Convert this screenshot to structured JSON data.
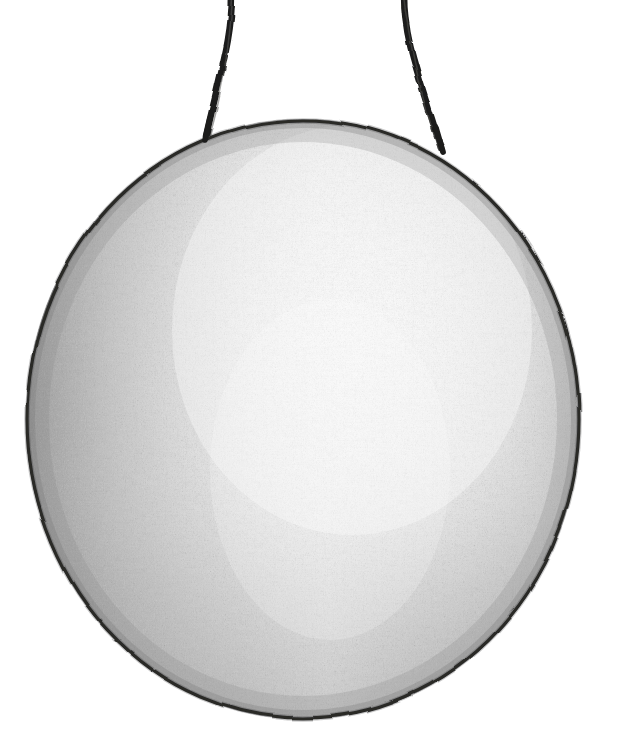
{
  "canvas": {
    "width": 623,
    "height": 748,
    "background_color": "#ffffff",
    "medium": "graphite pencil on paper",
    "title": "Hanging Gong"
  },
  "palette": {
    "paper_white": "#ffffff",
    "outline_dark": "#20201f",
    "cord_dark": "#1c1c1b",
    "shade_deep": "#8e8e8e",
    "shade_mid": "#b4b4b4",
    "shade_light": "#dcdcdc",
    "highlight": "#fafafa",
    "speckle": "#6f6f6f"
  },
  "subject": {
    "name": "gong-disc",
    "label": "Gong disc",
    "shape": "circle",
    "center_x": 303,
    "center_y": 419,
    "radius_x": 277,
    "radius_y": 300,
    "bounds": {
      "left": 26,
      "top": 119,
      "right": 580,
      "bottom": 719
    },
    "outline_width": 3.2
  },
  "cords": [
    {
      "name": "cord-left",
      "label": "Left suspension cord",
      "top_x": 232,
      "top_y": -6,
      "bottom_x": 206,
      "bottom_y": 136,
      "mid_x": 222,
      "mid_y": 66,
      "width": 6.5
    },
    {
      "name": "cord-right",
      "label": "Right suspension cord",
      "top_x": 404,
      "top_y": -6,
      "bottom_x": 441,
      "bottom_y": 148,
      "mid_x": 417,
      "mid_y": 70,
      "width": 6.5
    }
  ],
  "shading": {
    "description": "Soft graphite gradient: deepest tone along the left and lower-left rim, broad bright highlight through the centre and upper-right of the disc.",
    "highlight_center_x_pct": 58,
    "highlight_center_y_pct": 36,
    "stops": [
      {
        "offset_pct": 0,
        "color": "#fcfcfc",
        "opacity": 1
      },
      {
        "offset_pct": 32,
        "color": "#f0f0f0",
        "opacity": 1
      },
      {
        "offset_pct": 58,
        "color": "#d2d2d2",
        "opacity": 1
      },
      {
        "offset_pct": 80,
        "color": "#b0b0b0",
        "opacity": 1
      },
      {
        "offset_pct": 100,
        "color": "#979797",
        "opacity": 1
      }
    ],
    "edge_darkening": {
      "left_pct": 0.42,
      "bottom_pct": 0.34,
      "top_pct": 0.1,
      "right_pct": 0.16
    }
  },
  "texture": {
    "name": "pencil-grain",
    "description": "Dense vertical graphite stippling across the whole disc",
    "grain_seed": 7,
    "frequency": 0.85,
    "octaves": 4,
    "stipple_opacity": 0.34
  },
  "accessibility": {
    "alt_text": "Pencil drawing of a round gong hanging from two cords",
    "caption": ""
  }
}
